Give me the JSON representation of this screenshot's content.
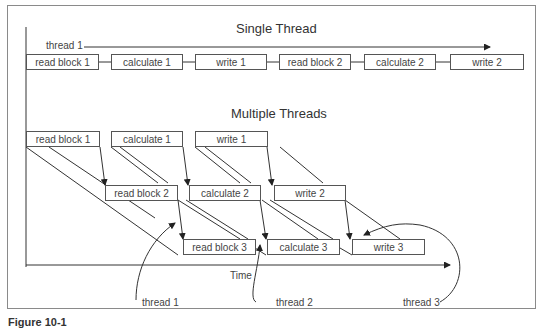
{
  "single": {
    "title": "Single Thread",
    "thread_label": "thread 1",
    "boxes": [
      "read block 1",
      "calculate 1",
      "write 1",
      "read block 2",
      "calculate 2",
      "write 2"
    ]
  },
  "multi": {
    "title": "Multiple Threads",
    "row1": [
      "read block 1",
      "calculate 1",
      "write 1"
    ],
    "row2": [
      "read block 2",
      "calculate 2",
      "write 2"
    ],
    "row3": [
      "read block 3",
      "calculate 3",
      "write 3"
    ],
    "time_label": "Time",
    "thread_labels": [
      "thread 1",
      "thread 2",
      "thread 3"
    ]
  },
  "caption": "Figure 10-1"
}
